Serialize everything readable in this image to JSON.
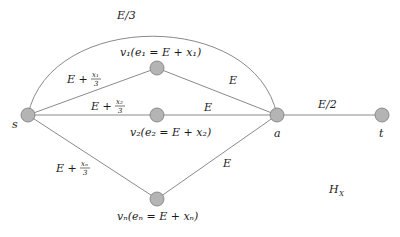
{
  "diagram": {
    "nodes": [
      {
        "id": "s",
        "label": "s",
        "x": 28,
        "y": 115
      },
      {
        "id": "v1",
        "label": "v₁(e₁ = E + x₁)",
        "x": 157,
        "y": 68
      },
      {
        "id": "v2",
        "label": "v₂(e₂ = E + x₂)",
        "x": 157,
        "y": 115
      },
      {
        "id": "vn",
        "label": "vₙ(eₙ = E + xₙ)",
        "x": 157,
        "y": 199
      },
      {
        "id": "a",
        "label": "a",
        "x": 277,
        "y": 115
      },
      {
        "id": "t",
        "label": "t",
        "x": 382,
        "y": 115
      }
    ],
    "edges": [
      {
        "from": "s",
        "to": "a",
        "label": "E/3",
        "curved": true
      },
      {
        "from": "s",
        "to": "v1",
        "label_main": "E +",
        "label_num": "x₁",
        "label_den": "3"
      },
      {
        "from": "s",
        "to": "v2",
        "label_main": "E +",
        "label_num": "x₂",
        "label_den": "3"
      },
      {
        "from": "s",
        "to": "vn",
        "label_main": "E +",
        "label_num": "xₙ",
        "label_den": "3"
      },
      {
        "from": "v1",
        "to": "a",
        "label": "E"
      },
      {
        "from": "v2",
        "to": "a",
        "label": "E"
      },
      {
        "from": "vn",
        "to": "a",
        "label": "E"
      },
      {
        "from": "a",
        "to": "t",
        "label": "E/2"
      }
    ],
    "graph_label": "H",
    "graph_label_sub": "X"
  }
}
